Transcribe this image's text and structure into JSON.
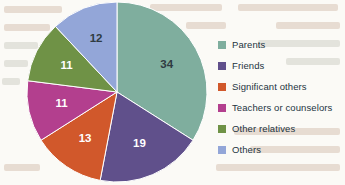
{
  "chart_data": {
    "type": "pie",
    "title": "",
    "xlabel": "",
    "ylabel": "",
    "legend_position": "right",
    "grid": false,
    "start_angle_oclock": 12,
    "direction": "clockwise",
    "total": 100,
    "categories": [
      "Parents",
      "Friends",
      "Significant others",
      "Teachers or counselors",
      "Other relatives",
      "Others"
    ],
    "values": [
      34,
      19,
      13,
      11,
      11,
      12
    ],
    "colors": [
      "#7fae9e",
      "#60508b",
      "#d1582b",
      "#b33f8e",
      "#6f9246",
      "#93a6d8"
    ],
    "label_colors": [
      "#2f3b42",
      "#ffffff",
      "#ffffff",
      "#ffffff",
      "#ffffff",
      "#2f3b42"
    ],
    "slices": [
      {
        "label": "Parents",
        "value": 34,
        "color": "#7fae9e",
        "label_color": "#2f3b42"
      },
      {
        "label": "Friends",
        "value": 19,
        "color": "#60508b",
        "label_color": "#ffffff"
      },
      {
        "label": "Significant others",
        "value": 13,
        "color": "#d1582b",
        "label_color": "#ffffff"
      },
      {
        "label": "Teachers or counselors",
        "value": 11,
        "color": "#b33f8e",
        "label_color": "#ffffff"
      },
      {
        "label": "Other relatives",
        "value": 11,
        "color": "#6f9246",
        "label_color": "#ffffff"
      },
      {
        "label": "Others",
        "value": 12,
        "color": "#93a6d8",
        "label_color": "#2f3b42"
      }
    ]
  },
  "legend": {
    "items": [
      {
        "label": "Parents",
        "color": "#7fae9e"
      },
      {
        "label": "Friends",
        "color": "#60508b"
      },
      {
        "label": "Significant others",
        "color": "#d1582b"
      },
      {
        "label": "Teachers or counselors",
        "color": "#b33f8e"
      },
      {
        "label": "Other relatives",
        "color": "#6f9246"
      },
      {
        "label": "Others",
        "color": "#93a6d8"
      }
    ]
  }
}
